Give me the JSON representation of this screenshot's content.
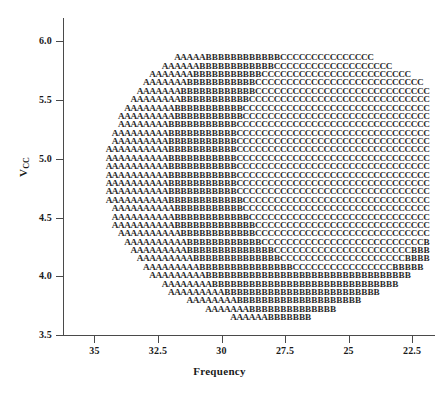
{
  "chart_data": {
    "type": "scatter",
    "title": "",
    "xlabel": "Frequency",
    "ylabel": "Vcc",
    "ylabel_base": "V",
    "ylabel_sub": "CC",
    "grid": false,
    "legend": "none",
    "x_ticks": [
      "35",
      "32.5",
      "30",
      "27.5",
      "25",
      "22.5"
    ],
    "x_tick_values": [
      35,
      32.5,
      30,
      27.5,
      25,
      22.5
    ],
    "y_ticks": [
      "6.0",
      "5.5",
      "5.0",
      "4.5",
      "4.0",
      "3.5"
    ],
    "y_tick_values": [
      6.0,
      5.5,
      5.0,
      4.5,
      4.0,
      3.5
    ],
    "xlim": [
      36.2,
      21.6
    ],
    "ylim": [
      3.5,
      6.2
    ],
    "x_axis_reversed": true,
    "marker_symbols": [
      "A",
      "B",
      "C"
    ],
    "marker_color": "#2b2b2b",
    "grid_step_x": 0.25,
    "grid_step_y": 0.0714,
    "regions": [
      {
        "symbol": "A",
        "note": "outer envelope, left and bottom of cloud"
      },
      {
        "symbol": "B",
        "note": "middle annulus, upper-middle and lower-right bands"
      },
      {
        "symbol": "C",
        "note": "inner core toward low frequency / mid Vcc and top right"
      }
    ],
    "points": [
      {
        "x": 31.75,
        "y": 5.857,
        "s": "A"
      },
      {
        "x": 31.5,
        "y": 5.857,
        "s": "A"
      },
      {
        "x": 31.25,
        "y": 5.857,
        "s": "A"
      },
      {
        "x": 31.0,
        "y": 5.857,
        "s": "A"
      },
      {
        "x": 30.75,
        "y": 5.857,
        "s": "A"
      },
      {
        "x": 30.5,
        "y": 5.857,
        "s": "A"
      },
      {
        "x": 30.25,
        "y": 5.857,
        "s": "A"
      },
      {
        "x": 30.0,
        "y": 5.857,
        "s": "A"
      },
      {
        "x": 29.75,
        "y": 5.857,
        "s": "A"
      },
      {
        "x": 29.5,
        "y": 5.857,
        "s": "A"
      },
      {
        "x": 29.25,
        "y": 5.857,
        "s": "A"
      },
      {
        "x": 29.0,
        "y": 5.857,
        "s": "A"
      },
      {
        "x": 28.75,
        "y": 5.857,
        "s": "A"
      },
      {
        "x": 28.5,
        "y": 5.857,
        "s": "A"
      },
      {
        "x": 28.25,
        "y": 5.857,
        "s": "B"
      },
      {
        "x": 28.0,
        "y": 5.857,
        "s": "B"
      },
      {
        "x": 27.75,
        "y": 5.857,
        "s": "B"
      },
      {
        "x": 27.5,
        "y": 5.857,
        "s": "B"
      },
      {
        "x": 27.25,
        "y": 5.857,
        "s": "B"
      },
      {
        "x": 27.0,
        "y": 5.857,
        "s": "B"
      },
      {
        "x": 26.75,
        "y": 5.857,
        "s": "B"
      },
      {
        "x": 26.5,
        "y": 5.857,
        "s": "B"
      },
      {
        "x": 26.25,
        "y": 5.857,
        "s": "C"
      },
      {
        "x": 26.0,
        "y": 5.857,
        "s": "C"
      },
      {
        "x": 25.75,
        "y": 5.857,
        "s": "C"
      },
      {
        "x": 25.5,
        "y": 5.857,
        "s": "C"
      },
      {
        "x": 25.25,
        "y": 5.857,
        "s": "C"
      },
      {
        "x": 25.0,
        "y": 5.857,
        "s": "C"
      },
      {
        "x": 24.75,
        "y": 5.857,
        "s": "C"
      },
      {
        "x": 24.5,
        "y": 5.857,
        "s": "C"
      },
      {
        "x": 24.25,
        "y": 5.857,
        "s": "C"
      }
    ]
  },
  "axes": {
    "y_label_base": "V",
    "y_label_sub": "CC",
    "x_label": "Frequency"
  }
}
